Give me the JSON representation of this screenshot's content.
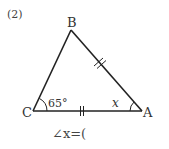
{
  "problem": {
    "number_label": "(2)",
    "answer_prompt": "∠x=(",
    "answer_prompt_parts": {
      "angle_symbol": "∠",
      "variable": "x",
      "equals": "=",
      "open_bracket": "("
    }
  },
  "triangle": {
    "vertices": [
      {
        "name": "B",
        "x": 71,
        "y": 30
      },
      {
        "name": "C",
        "x": 33,
        "y": 111
      },
      {
        "name": "A",
        "x": 142,
        "y": 111
      }
    ],
    "angle_labels": [
      {
        "vertex": "C",
        "text": "65°"
      },
      {
        "vertex": "A",
        "text": "x"
      }
    ],
    "equal_sides": [
      {
        "side": "BA",
        "marks": 2
      },
      {
        "side": "CA",
        "marks": 2
      }
    ]
  },
  "colors": {
    "line": "#222222",
    "text": "#333333",
    "background": "#ffffff"
  }
}
